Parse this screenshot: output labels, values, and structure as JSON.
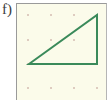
{
  "exercise": {
    "label": "f)"
  },
  "colors": {
    "panel_background": "#fbfbea",
    "panel_border": "#9a9a9a",
    "dot": "#c9a8a0",
    "triangle_stroke": "#3a8a5a"
  },
  "grid": {
    "columns_x": [
      28,
      51,
      74,
      97
    ],
    "rows_y": [
      15,
      40,
      64,
      88
    ]
  },
  "triangle": {
    "shape": "right-triangle",
    "vertices": [
      [
        29,
        64
      ],
      [
        97,
        15
      ],
      [
        97,
        64
      ]
    ],
    "grid_vertices": [
      [
        0,
        2
      ],
      [
        3,
        0
      ],
      [
        3,
        2
      ]
    ]
  }
}
